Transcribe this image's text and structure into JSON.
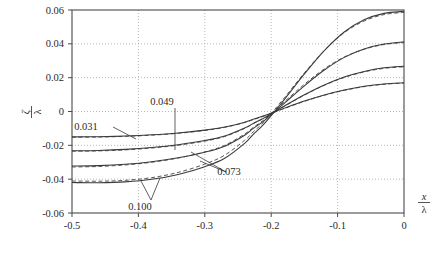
{
  "chart_data": {
    "type": "line",
    "title": "",
    "xlabel": "x / λ",
    "ylabel": "ζ / λ",
    "xlim": [
      -0.5,
      0.0
    ],
    "ylim": [
      -0.06,
      0.06
    ],
    "xticks": [
      "-0.5",
      "-0.4",
      "-0.3",
      "-0.2",
      "-0.1",
      "0"
    ],
    "xtick_values": [
      -0.5,
      -0.4,
      -0.3,
      -0.2,
      -0.1,
      0
    ],
    "yticks": [
      "0.06",
      "0.04",
      "0.02",
      "0",
      "-0.02",
      "-0.04",
      "-0.06"
    ],
    "ytick_values": [
      0.06,
      0.04,
      0.02,
      0,
      -0.02,
      -0.04,
      -0.06
    ],
    "grid": "dotted",
    "legend_position": "inline-annotations",
    "line_color": "#3a3a3a",
    "grid_color": "#9a9a9a",
    "axis_color": "#4a4a4a",
    "crossing_x": -0.227,
    "series": [
      {
        "name": "0.031",
        "style": "solid+dashed pair",
        "x": [
          -0.5,
          -0.46,
          -0.42,
          -0.38,
          -0.34,
          -0.3,
          -0.27,
          -0.24,
          -0.227,
          -0.21,
          -0.18,
          -0.15,
          -0.12,
          -0.09,
          -0.06,
          -0.03,
          0.0
        ],
        "values": [
          -0.015,
          -0.0149,
          -0.0145,
          -0.0138,
          -0.0127,
          -0.011,
          -0.0092,
          -0.0063,
          -0.0046,
          -0.0024,
          0.002,
          0.0062,
          0.0098,
          0.0127,
          0.0149,
          0.0163,
          0.017
        ],
        "dashed_values": [
          -0.0152,
          -0.0151,
          -0.0147,
          -0.014,
          -0.0129,
          -0.0112,
          -0.0094,
          -0.0065,
          -0.0048,
          -0.0026,
          0.0018,
          0.006,
          0.0096,
          0.0125,
          0.0147,
          0.0161,
          0.0168
        ]
      },
      {
        "name": "0.049",
        "style": "solid+dashed pair",
        "x": [
          -0.5,
          -0.46,
          -0.42,
          -0.38,
          -0.34,
          -0.3,
          -0.27,
          -0.24,
          -0.227,
          -0.21,
          -0.18,
          -0.15,
          -0.12,
          -0.09,
          -0.06,
          -0.03,
          0.0
        ],
        "values": [
          -0.0232,
          -0.023,
          -0.0224,
          -0.0213,
          -0.0196,
          -0.0172,
          -0.0145,
          -0.0098,
          -0.007,
          -0.0036,
          0.0033,
          0.0099,
          0.0157,
          0.0204,
          0.0237,
          0.0258,
          0.0267
        ],
        "dashed_values": [
          -0.0235,
          -0.0233,
          -0.0227,
          -0.0216,
          -0.0199,
          -0.0175,
          -0.0148,
          -0.01,
          -0.0072,
          -0.0038,
          0.0031,
          0.0097,
          0.0155,
          0.0201,
          0.0234,
          0.0255,
          0.0264
        ]
      },
      {
        "name": "0.073",
        "style": "solid+dashed pair",
        "x": [
          -0.5,
          -0.46,
          -0.42,
          -0.38,
          -0.34,
          -0.3,
          -0.27,
          -0.24,
          -0.227,
          -0.21,
          -0.18,
          -0.15,
          -0.12,
          -0.09,
          -0.06,
          -0.03,
          0.0
        ],
        "values": [
          -0.0322,
          -0.032,
          -0.0312,
          -0.0297,
          -0.0274,
          -0.0241,
          -0.0205,
          -0.014,
          -0.01,
          -0.0052,
          0.005,
          0.0152,
          0.0245,
          0.032,
          0.037,
          0.0399,
          0.0412
        ],
        "dashed_values": [
          -0.0328,
          -0.0325,
          -0.0316,
          -0.03,
          -0.0275,
          -0.0239,
          -0.02,
          -0.0133,
          -0.0094,
          -0.0046,
          0.0058,
          0.0161,
          0.0252,
          0.0322,
          0.0368,
          0.0396,
          0.0408
        ]
      },
      {
        "name": "0.100",
        "style": "solid+dashed pair",
        "x": [
          -0.5,
          -0.46,
          -0.42,
          -0.38,
          -0.34,
          -0.3,
          -0.27,
          -0.24,
          -0.227,
          -0.21,
          -0.18,
          -0.15,
          -0.12,
          -0.09,
          -0.06,
          -0.03,
          0.0
        ],
        "values": [
          -0.042,
          -0.0421,
          -0.0416,
          -0.0401,
          -0.0372,
          -0.0326,
          -0.0276,
          -0.0188,
          -0.0135,
          -0.007,
          0.0072,
          0.0222,
          0.036,
          0.047,
          0.0542,
          0.058,
          0.0592
        ],
        "dashed_values": [
          -0.0411,
          -0.0412,
          -0.0407,
          -0.0391,
          -0.036,
          -0.0311,
          -0.0258,
          -0.017,
          -0.012,
          -0.0057,
          0.0082,
          0.0228,
          0.0361,
          0.0466,
          0.0535,
          0.0573,
          0.0586
        ]
      }
    ],
    "annotations": [
      {
        "label": "0.031",
        "text_x": 86,
        "text_y": 130,
        "leaders": [
          [
            113,
            127,
            136,
            139
          ]
        ]
      },
      {
        "label": "0.049",
        "text_x": 162,
        "text_y": 105,
        "leaders": [
          [
            175,
            108,
            175,
            150
          ]
        ]
      },
      {
        "label": "0.073",
        "text_x": 229,
        "text_y": 175,
        "leaders": [
          [
            226,
            172,
            191,
            152
          ],
          [
            226,
            172,
            200,
            161
          ]
        ]
      },
      {
        "label": "0.100",
        "text_x": 140,
        "text_y": 210,
        "leaders": [
          [
            151,
            200,
            160,
            178
          ],
          [
            151,
            200,
            141,
            181
          ]
        ]
      }
    ]
  }
}
